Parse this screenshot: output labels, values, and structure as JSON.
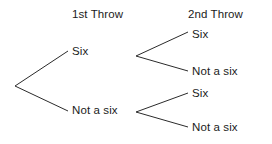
{
  "diagram": {
    "type": "probability-tree",
    "title": "",
    "background_color": "#ffffff",
    "line_color": "#2b2b2b",
    "text_color": "#1b1b1b",
    "headers": [
      {
        "label": "1st Throw",
        "x": 112,
        "y": 8
      },
      {
        "label": "2nd Throw",
        "x": 222,
        "y": 8
      }
    ],
    "nodes": {
      "root": {
        "label": "",
        "x": 14,
        "y": 86
      },
      "level1": [
        {
          "id": "six",
          "label": "Six",
          "text_x": 72,
          "text_y": 45,
          "branch_x": 135,
          "branch_y": 56
        },
        {
          "id": "not-a-six",
          "label": "Not a six",
          "text_x": 72,
          "text_y": 104,
          "branch_x": 135,
          "branch_y": 112
        }
      ],
      "level2": [
        {
          "id": "six-six",
          "label": "Six",
          "text_x": 192,
          "text_y": 28
        },
        {
          "id": "six-not",
          "label": "Not a six",
          "text_x": 192,
          "text_y": 66
        },
        {
          "id": "not-six",
          "label": "Six",
          "text_x": 192,
          "text_y": 89
        },
        {
          "id": "not-not",
          "label": "Not a six",
          "text_x": 192,
          "text_y": 122
        }
      ]
    },
    "edges": [
      {
        "name": "root-to-six",
        "x1": 15,
        "y1": 86,
        "x2": 68,
        "y2": 51
      },
      {
        "name": "root-to-not-a-six",
        "x1": 15,
        "y1": 86,
        "x2": 68,
        "y2": 111
      },
      {
        "name": "six-to-six",
        "x1": 136,
        "y1": 56,
        "x2": 188,
        "y2": 32
      },
      {
        "name": "six-to-not-a-six",
        "x1": 136,
        "y1": 56,
        "x2": 188,
        "y2": 71
      },
      {
        "name": "not-a-six-to-six",
        "x1": 136,
        "y1": 112,
        "x2": 188,
        "y2": 93
      },
      {
        "name": "not-a-six-to-not-a-six",
        "x1": 136,
        "y1": 112,
        "x2": 188,
        "y2": 127
      }
    ]
  }
}
